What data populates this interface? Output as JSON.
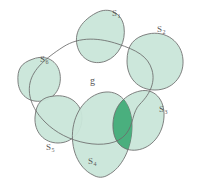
{
  "figure": {
    "kind": "set-cover-venn-diagram",
    "background_color": "#ffffff",
    "stroke_color": "#6b6b6b",
    "fill_color": "#c9e6d9",
    "highlight_color": "#3faa76",
    "label_color": "#5a5a5a"
  },
  "ground_set": {
    "name": "g",
    "label": "g",
    "filled": false
  },
  "subsets": [
    {
      "id": "S1",
      "label": "S",
      "sub": "1",
      "label_x": 112,
      "label_y": 9,
      "filled": true
    },
    {
      "id": "S2",
      "label": "S",
      "sub": "2",
      "label_x": 157,
      "label_y": 25,
      "filled": true
    },
    {
      "id": "S3",
      "label": "S",
      "sub": "3",
      "label_x": 159,
      "label_y": 105,
      "filled": true
    },
    {
      "id": "S4",
      "label": "S",
      "sub": "4",
      "label_x": 88,
      "label_y": 157,
      "filled": true
    },
    {
      "id": "S5",
      "label": "S",
      "sub": "5",
      "label_x": 46,
      "label_y": 143,
      "filled": true
    },
    {
      "id": "S6",
      "label": "S",
      "sub": "6",
      "label_x": 40,
      "label_y": 55,
      "filled": true
    }
  ],
  "highlighted_intersection": {
    "between": [
      "S3",
      "S4"
    ],
    "color": "#3faa76"
  }
}
